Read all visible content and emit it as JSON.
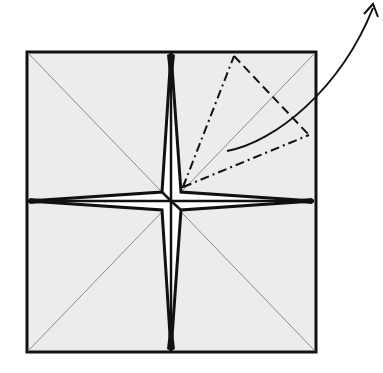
{
  "diagram": {
    "type": "origami-fold-step",
    "colors": {
      "paper": "#ececec",
      "line": "#111111",
      "crease": "#8a8a8a",
      "background": "#ffffff"
    },
    "elements": {
      "paper_square": "square sheet with diagonal creases",
      "star_flaps": "four-pointed star of raised flaps",
      "valley_fold": "dash-dot fold lines",
      "mountain_fold": "dashed fold line",
      "arrow": "curved fold arrow pointing up-right"
    }
  }
}
